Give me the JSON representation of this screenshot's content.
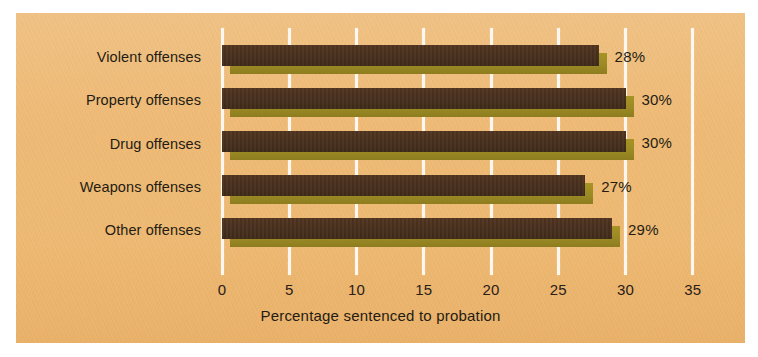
{
  "chart_data": {
    "type": "bar",
    "orientation": "horizontal",
    "title": "",
    "subtitle": "",
    "xlabel": "Percentage sentenced to probation",
    "ylabel": "",
    "categories": [
      "Violent offenses",
      "Property offenses",
      "Drug offenses",
      "Weapons offenses",
      "Other offenses"
    ],
    "values": [
      28,
      30,
      30,
      27,
      29
    ],
    "value_labels": [
      "28%",
      "30%",
      "30%",
      "27%",
      "29%"
    ],
    "xlim": [
      0,
      35
    ],
    "xticks": [
      0,
      5,
      10,
      15,
      20,
      25,
      30,
      35
    ],
    "xtick_labels": [
      "0",
      "5",
      "10",
      "15",
      "20",
      "25",
      "30",
      "35"
    ],
    "grid": "vertical-white-gridlines",
    "legend": "none",
    "style": "3d-bar",
    "colors": {
      "background": "#edb873",
      "bar_face": "#48301d",
      "bar_shadow": "#9b8a24",
      "gridline": "#fdf7ef",
      "text": "#241c14",
      "page": "#ffffff"
    }
  }
}
